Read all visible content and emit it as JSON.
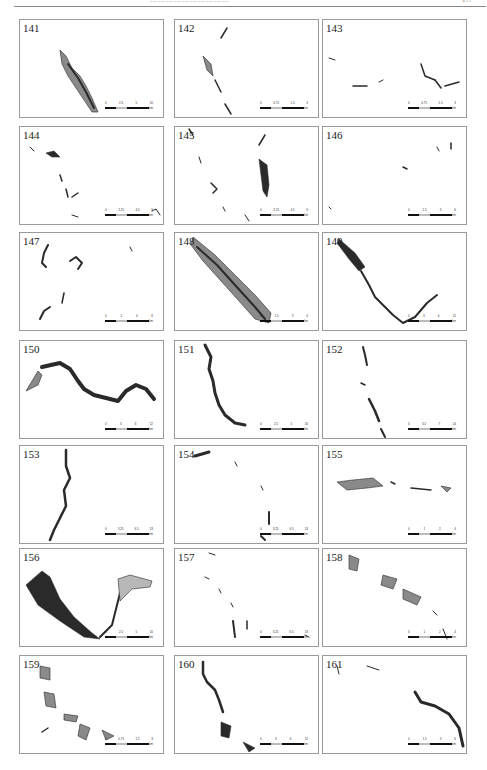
{
  "page": {
    "header_text": "…………………………",
    "page_number": "1??"
  },
  "panels": [
    {
      "id": "141",
      "scale": [
        "0",
        "2.5",
        "5",
        "10"
      ],
      "unit": "km"
    },
    {
      "id": "142",
      "scale": [
        "0",
        "0.75",
        "1.5",
        "3"
      ],
      "unit": "km"
    },
    {
      "id": "143",
      "scale": [
        "0",
        "0.75",
        "1.5",
        "3"
      ],
      "unit": "km"
    },
    {
      "id": "144",
      "scale": [
        "0",
        "2.25",
        "4.5",
        "9"
      ],
      "unit": "km"
    },
    {
      "id": "145",
      "scale": [
        "0",
        "2.25",
        "4.5",
        "9"
      ],
      "unit": "km"
    },
    {
      "id": "146",
      "scale": [
        "0",
        "1.5",
        "3",
        "6"
      ],
      "unit": "km"
    },
    {
      "id": "147",
      "scale": [
        "0",
        "2",
        "4",
        "8"
      ],
      "unit": "km"
    },
    {
      "id": "148",
      "scale": [
        "0",
        "1.5",
        "3",
        "6"
      ],
      "unit": "km"
    },
    {
      "id": "149",
      "scale": [
        "0",
        "3",
        "6",
        "12"
      ],
      "unit": "km"
    },
    {
      "id": "150",
      "scale": [
        "0",
        "3",
        "6",
        "12"
      ],
      "unit": "km"
    },
    {
      "id": "151",
      "scale": [
        "0",
        "2.5",
        "5",
        "10"
      ],
      "unit": "km"
    },
    {
      "id": "152",
      "scale": [
        "0",
        "3.5",
        "7",
        "14"
      ],
      "unit": "km"
    },
    {
      "id": "153",
      "scale": [
        "0",
        "3.25",
        "6.5",
        "13"
      ],
      "unit": "km"
    },
    {
      "id": "154",
      "scale": [
        "0",
        "3.25",
        "6.5",
        "13"
      ],
      "unit": "km"
    },
    {
      "id": "155",
      "scale": [
        "0",
        "1",
        "2",
        "4"
      ],
      "unit": "km"
    },
    {
      "id": "156",
      "scale": [
        "0",
        "2.5",
        "5",
        "10"
      ],
      "unit": "km"
    },
    {
      "id": "157",
      "scale": [
        "0",
        "3.25",
        "6.5",
        "13"
      ],
      "unit": "km"
    },
    {
      "id": "158",
      "scale": [
        "0",
        "1",
        "2",
        "4"
      ],
      "unit": "km"
    },
    {
      "id": "159",
      "scale": [
        "0",
        "0.75",
        "1.5",
        "3"
      ],
      "unit": "km"
    },
    {
      "id": "160",
      "scale": [
        "0",
        "3",
        "6",
        "12"
      ],
      "unit": "km"
    },
    {
      "id": "161",
      "scale": [
        "0",
        "1.5",
        "3",
        "6"
      ],
      "unit": "km"
    }
  ],
  "colors": {
    "border": "#9a9a9a",
    "river_fill": "#8a8a8a",
    "river_dark": "#2a2a2a",
    "river_light": "#b8b8b8"
  }
}
